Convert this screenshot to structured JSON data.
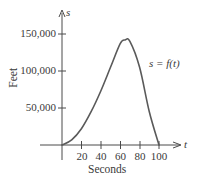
{
  "chart_data": {
    "type": "line",
    "title": "",
    "xlabel": "Seconds",
    "ylabel": "Feet",
    "x_axis_var": "t",
    "y_axis_var": "s",
    "curve_label": "s = f(t)",
    "xlim": [
      0,
      100
    ],
    "ylim": [
      0,
      150000
    ],
    "x_ticks": [
      "20",
      "40",
      "60",
      "80",
      "100"
    ],
    "y_ticks": [
      "50,000",
      "100,000",
      "150,000"
    ],
    "grid": false,
    "legend": "none",
    "series": [
      {
        "name": "s = f(t)",
        "x": [
          0,
          10,
          20,
          30,
          40,
          50,
          60,
          65,
          70,
          80,
          90,
          100
        ],
        "values": [
          0,
          7000,
          22000,
          45000,
          73000,
          105000,
          137000,
          142000,
          140000,
          105000,
          45000,
          0
        ]
      }
    ]
  },
  "colors": {
    "axis": "#4a4a4a",
    "curve": "#5a5a5a",
    "text": "#3a3a3a"
  }
}
